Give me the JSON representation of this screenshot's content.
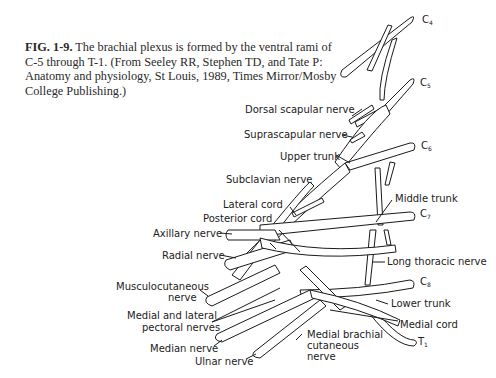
{
  "caption": {
    "figure_label": "FIG. 1-9.",
    "text": "The brachial plexus is formed by the ventral rami of C-5 through T-1. (From Seeley RR, Stephen TD, and Tate P: Anatomy and physiology, St Louis, 1989, Times Mirror/Mosby College Publishing.)"
  },
  "roots": [
    {
      "letter": "C",
      "sub": "4"
    },
    {
      "letter": "C",
      "sub": "5"
    },
    {
      "letter": "C",
      "sub": "6"
    },
    {
      "letter": "C",
      "sub": "7"
    },
    {
      "letter": "C",
      "sub": "8"
    },
    {
      "letter": "T",
      "sub": "1"
    }
  ],
  "labels": {
    "dorsal_scapular": "Dorsal scapular nerve",
    "suprascapular": "Suprascapular nerve",
    "upper_trunk": "Upper trunk",
    "subclavian": "Subclavian nerve",
    "lateral_cord": "Lateral cord",
    "posterior_cord": "Posterior cord",
    "axillary": "Axillary nerve",
    "radial": "Radial nerve",
    "middle_trunk": "Middle trunk",
    "long_thoracic": "Long thoracic nerve",
    "musculocutaneous_1": "Musculocutaneous",
    "musculocutaneous_2": "nerve",
    "pectoral_1": "Medial and lateral",
    "pectoral_2": "pectoral nerves",
    "median": "Median nerve",
    "ulnar": "Ulnar nerve",
    "medial_brachial_1": "Medial brachial",
    "medial_brachial_2": "cutaneous",
    "medial_brachial_3": "nerve",
    "lower_trunk": "Lower trunk",
    "medial_cord": "Medial cord"
  }
}
